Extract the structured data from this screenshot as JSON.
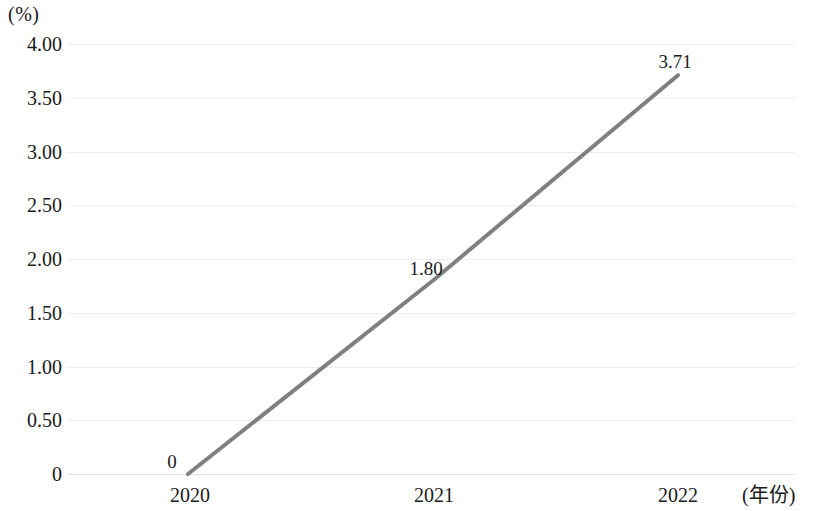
{
  "chart_data": {
    "type": "line",
    "title": "",
    "subtitle": "",
    "xlabel": "(年份)",
    "ylabel": "(%)",
    "categories": [
      "2020",
      "2021",
      "2022"
    ],
    "x": [
      2020,
      2021,
      2022
    ],
    "values": [
      0,
      1.8,
      3.71
    ],
    "point_labels": [
      "0",
      "1.80",
      "3.71"
    ],
    "series": [
      {
        "name": "",
        "values": [
          0,
          1.8,
          3.71
        ],
        "color": "#808080"
      }
    ],
    "ylim": [
      0,
      4.0
    ],
    "ytick_values": [
      4.0,
      3.5,
      3.0,
      2.5,
      2.0,
      1.5,
      1.0,
      0.5,
      0
    ],
    "ytick_labels": [
      "4.00",
      "3.50",
      "3.00",
      "2.50",
      "2.00",
      "1.50",
      "1.00",
      "0.50",
      "0"
    ],
    "xtick_labels": [
      "2020",
      "2021",
      "2022"
    ],
    "grid": "horizontal",
    "grid_color": "#ededed",
    "legend": "none",
    "legend_position": "none",
    "line_color": "#808080",
    "line_width": 4,
    "markers": "none",
    "background": "#ffffff"
  },
  "axes": {
    "y_unit_label": "(%)",
    "x_unit_label": "(年份)"
  }
}
